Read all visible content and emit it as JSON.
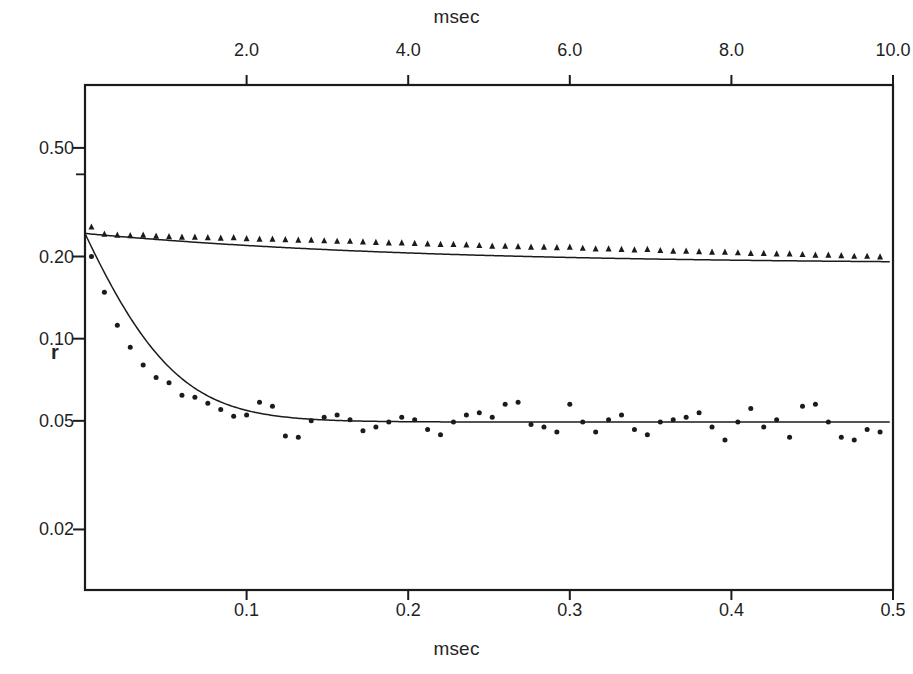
{
  "figure": {
    "background": "#ffffff",
    "ink_color": "#1b1b1b",
    "width": 913,
    "height": 674
  },
  "axes": {
    "top": {
      "title": "msec",
      "ticks": [
        "2.0",
        "4.0",
        "6.0",
        "8.0",
        "10.0"
      ],
      "tick_values": [
        2.0,
        4.0,
        6.0,
        8.0,
        10.0
      ],
      "range": [
        0,
        10
      ]
    },
    "bottom": {
      "title": "msec",
      "ticks": [
        "0.1",
        "0.2",
        "0.3",
        "0.4",
        "0.5"
      ],
      "tick_values": [
        0.1,
        0.2,
        0.3,
        0.4,
        0.5
      ],
      "range": [
        0,
        0.5
      ]
    },
    "left": {
      "title": "r",
      "scale": "log",
      "ticks": [
        "0.50",
        "0.20",
        "0.10",
        "0.05",
        "0.02"
      ],
      "tick_values": [
        0.5,
        0.2,
        0.1,
        0.05,
        0.02
      ],
      "minor_tick_values": [
        0.4
      ],
      "range": [
        0.012,
        0.85
      ]
    }
  },
  "chart_data": {
    "type": "scatter",
    "title": "",
    "xlabel": "msec",
    "ylabel": "r",
    "grid": false,
    "legend": null,
    "x_scale": "linear",
    "y_scale": "log",
    "xlim": [
      0,
      0.5
    ],
    "ylim": [
      0.012,
      0.85
    ],
    "secondary_xaxis": {
      "label": "msec",
      "lim": [
        0,
        10
      ],
      "ticks": [
        2.0,
        4.0,
        6.0,
        8.0,
        10.0
      ]
    },
    "series": [
      {
        "name": "slow-decay",
        "marker": "triangle",
        "fit": "exponential-decay",
        "fit_params": {
          "r0": 0.243,
          "r_inf": 0.188,
          "tau_msec": 3.6,
          "time_axis": "top"
        },
        "x": [
          0.004,
          0.012,
          0.02,
          0.028,
          0.036,
          0.044,
          0.052,
          0.06,
          0.068,
          0.076,
          0.084,
          0.092,
          0.1,
          0.108,
          0.116,
          0.124,
          0.132,
          0.14,
          0.148,
          0.156,
          0.164,
          0.172,
          0.18,
          0.188,
          0.196,
          0.204,
          0.212,
          0.22,
          0.228,
          0.236,
          0.244,
          0.252,
          0.26,
          0.268,
          0.276,
          0.284,
          0.292,
          0.3,
          0.308,
          0.316,
          0.324,
          0.332,
          0.34,
          0.348,
          0.356,
          0.364,
          0.372,
          0.38,
          0.388,
          0.396,
          0.404,
          0.412,
          0.42,
          0.428,
          0.436,
          0.444,
          0.452,
          0.46,
          0.468,
          0.476,
          0.484,
          0.492
        ],
        "y": [
          0.256,
          0.241,
          0.239,
          0.238,
          0.239,
          0.237,
          0.236,
          0.235,
          0.235,
          0.234,
          0.233,
          0.234,
          0.232,
          0.231,
          0.231,
          0.23,
          0.229,
          0.229,
          0.228,
          0.227,
          0.227,
          0.226,
          0.225,
          0.224,
          0.224,
          0.223,
          0.222,
          0.221,
          0.221,
          0.22,
          0.219,
          0.218,
          0.218,
          0.217,
          0.216,
          0.216,
          0.215,
          0.216,
          0.214,
          0.213,
          0.213,
          0.212,
          0.211,
          0.212,
          0.21,
          0.209,
          0.209,
          0.208,
          0.207,
          0.207,
          0.206,
          0.205,
          0.205,
          0.204,
          0.204,
          0.203,
          0.202,
          0.202,
          0.201,
          0.2,
          0.2,
          0.199
        ]
      },
      {
        "name": "fast-decay",
        "marker": "dot",
        "fit": "exponential-decay",
        "fit_params": {
          "r0": 0.243,
          "r_inf": 0.0495,
          "tau_msec": 0.55,
          "time_axis": "top"
        },
        "x": [
          0.004,
          0.012,
          0.02,
          0.028,
          0.036,
          0.044,
          0.052,
          0.06,
          0.068,
          0.076,
          0.084,
          0.092,
          0.1,
          0.108,
          0.116,
          0.124,
          0.132,
          0.14,
          0.148,
          0.156,
          0.164,
          0.172,
          0.18,
          0.188,
          0.196,
          0.204,
          0.212,
          0.22,
          0.228,
          0.236,
          0.244,
          0.252,
          0.26,
          0.268,
          0.276,
          0.284,
          0.292,
          0.3,
          0.308,
          0.316,
          0.324,
          0.332,
          0.34,
          0.348,
          0.356,
          0.364,
          0.372,
          0.38,
          0.388,
          0.396,
          0.404,
          0.412,
          0.42,
          0.428,
          0.436,
          0.444,
          0.452,
          0.46,
          0.468,
          0.476,
          0.484,
          0.492
        ],
        "y": [
          0.2,
          0.148,
          0.112,
          0.093,
          0.08,
          0.072,
          0.069,
          0.062,
          0.061,
          0.058,
          0.055,
          0.052,
          0.0525,
          0.0585,
          0.0565,
          0.044,
          0.0435,
          0.05,
          0.0515,
          0.0525,
          0.0505,
          0.046,
          0.0475,
          0.0495,
          0.0515,
          0.0505,
          0.0465,
          0.0445,
          0.0495,
          0.0525,
          0.0535,
          0.0515,
          0.0575,
          0.0585,
          0.0485,
          0.0475,
          0.0455,
          0.0575,
          0.0495,
          0.0455,
          0.0505,
          0.0525,
          0.0465,
          0.0445,
          0.0495,
          0.0505,
          0.0515,
          0.0535,
          0.0475,
          0.0425,
          0.0495,
          0.0555,
          0.0475,
          0.0505,
          0.0435,
          0.0565,
          0.0575,
          0.0495,
          0.0435,
          0.0425,
          0.0465,
          0.0455
        ]
      }
    ]
  }
}
